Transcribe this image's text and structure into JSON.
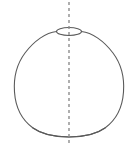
{
  "figure": {
    "title": "Dome-shaped solid of revolution with circular top opening",
    "background_color": "#ffffff",
    "width": 138,
    "height": 149,
    "elements": {
      "body_outline": {
        "name": "dome-body-outline",
        "description": "Rounded dome / vase silhouette, flat-ish base, narrow top",
        "stroke_color": "#5a5a5a",
        "stroke_width": 1.1,
        "fill": "none",
        "path": "M 56.5,31.5 C 46,32.5 34,41 25,53 C 16,65 13.5,78 14.5,92 C 15.5,107 22,120 33,128 C 42,134.5 54,137 69,137 C 84,137 96,134.5 105,128 C 116,120 122.5,107 123.5,92 C 124.5,78 122,65 113,53 C 104,41 92,32.5 81.5,31.5"
      },
      "base_curve": {
        "name": "base-ellipse-front-arc",
        "description": "Front half of the base circle seen in perspective",
        "stroke_color": "#5a5a5a",
        "stroke_width": 1.1,
        "fill": "none",
        "path": "M 33,128 C 42,134.5 54,137 69,137 C 84,137 96,134.5 105,128"
      },
      "top_opening_ellipse": {
        "name": "top-opening-ellipse",
        "description": "Small ellipse representing the circular opening at the top of the dome",
        "center_x": 69,
        "center_y": 31.5,
        "radius_x": 12.5,
        "radius_y": 4.0,
        "stroke_color": "#5a5a5a",
        "stroke_width": 1.1,
        "fill": "none"
      },
      "axis_line": {
        "name": "axis-of-revolution-dashed-line",
        "description": "Vertical dashed line marking the axis of revolution / symmetry",
        "x": 69,
        "y_top": 2,
        "y_bottom": 146,
        "stroke_color": "#8d8d8d",
        "stroke_width": 1.4,
        "dash_pattern": "3 3"
      }
    }
  }
}
